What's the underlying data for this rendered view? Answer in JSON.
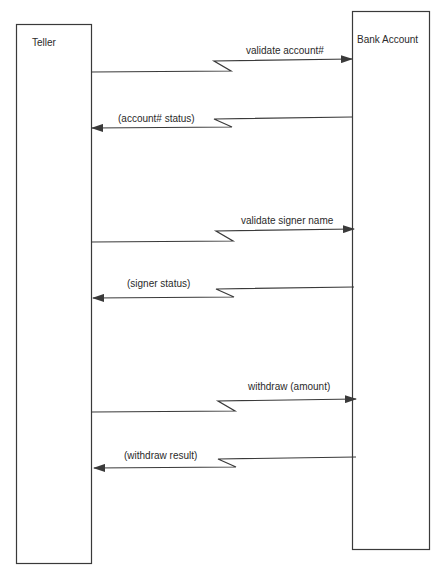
{
  "diagram": {
    "type": "sequence",
    "participants": [
      {
        "id": "teller",
        "label": "Teller"
      },
      {
        "id": "bank",
        "label": "Bank Account"
      }
    ],
    "messages": [
      {
        "from": "teller",
        "to": "bank",
        "label": "validate account#",
        "kind": "request"
      },
      {
        "from": "bank",
        "to": "teller",
        "label": "(account# status)",
        "kind": "reply"
      },
      {
        "from": "teller",
        "to": "bank",
        "label": "validate signer name",
        "kind": "request"
      },
      {
        "from": "bank",
        "to": "teller",
        "label": "(signer status)",
        "kind": "reply"
      },
      {
        "from": "teller",
        "to": "bank",
        "label": "withdraw (amount)",
        "kind": "request"
      },
      {
        "from": "bank",
        "to": "teller",
        "label": "(withdraw result)",
        "kind": "reply"
      }
    ],
    "colors": {
      "stroke": "#3a3a3a",
      "background": "#ffffff"
    }
  }
}
